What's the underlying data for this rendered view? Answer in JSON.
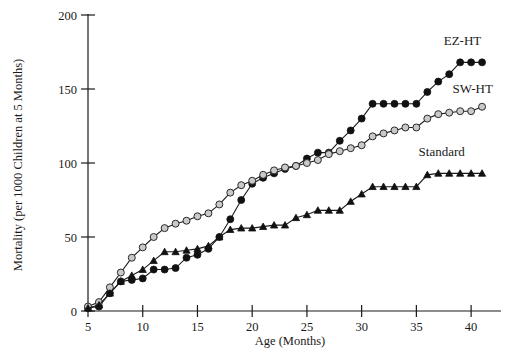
{
  "chart_data": {
    "type": "line",
    "title": "",
    "xlabel": "Age (Months)",
    "ylabel": "Mortality (per 1000 Children at 5 Months)",
    "xlim": [
      4,
      41.5
    ],
    "ylim": [
      0,
      200
    ],
    "xticks": [
      5,
      10,
      15,
      20,
      25,
      30,
      35,
      40
    ],
    "yticks": [
      0,
      50,
      100,
      150,
      200
    ],
    "grid": false,
    "legend_position": "right-inline-annotations",
    "x": [
      5,
      6,
      7,
      8,
      9,
      10,
      11,
      12,
      13,
      14,
      15,
      16,
      17,
      18,
      19,
      20,
      21,
      22,
      23,
      24,
      25,
      26,
      27,
      28,
      29,
      30,
      31,
      32,
      33,
      34,
      35,
      36,
      37,
      38,
      39,
      40,
      41
    ],
    "series": [
      {
        "name": "EZ-HT",
        "marker": "filled-circle",
        "values": [
          2,
          3,
          12,
          20,
          21,
          22,
          28,
          28,
          29,
          36,
          38,
          42,
          50,
          62,
          75,
          86,
          90,
          93,
          96,
          98,
          103,
          107,
          107,
          115,
          122,
          130,
          140,
          140,
          140,
          140,
          140,
          148,
          155,
          160,
          168,
          168,
          168
        ]
      },
      {
        "name": "SW-HT",
        "marker": "open-circle",
        "values": [
          3,
          6,
          16,
          26,
          36,
          43,
          50,
          56,
          59,
          61,
          64,
          66,
          72,
          80,
          85,
          88,
          92,
          95,
          97,
          98,
          100,
          102,
          106,
          108,
          110,
          112,
          118,
          120,
          122,
          124,
          124,
          130,
          133,
          134,
          135,
          135,
          138
        ]
      },
      {
        "name": "Standard",
        "marker": "triangle",
        "values": [
          2,
          4,
          12,
          20,
          24,
          28,
          34,
          40,
          40,
          41,
          42,
          44,
          50,
          55,
          56,
          56,
          57,
          58,
          58,
          63,
          65,
          68,
          68,
          68,
          74,
          79,
          84,
          84,
          84,
          84,
          84,
          92,
          93,
          93,
          93,
          93,
          93
        ]
      }
    ],
    "annotations": [
      {
        "text": "EZ-HT",
        "x": 37.5,
        "y": 180
      },
      {
        "text": "SW-HT",
        "x": 38.3,
        "y": 147
      },
      {
        "text": "Standard",
        "x": 35.2,
        "y": 105
      }
    ]
  },
  "axis": {
    "y_title": "Mortality (per 1000 Children at 5 Months)",
    "x_title": "Age (Months)",
    "y_tick_labels": [
      "0",
      "50",
      "100",
      "150",
      "200"
    ],
    "x_tick_labels": [
      "5",
      "10",
      "15",
      "20",
      "25",
      "30",
      "35",
      "40"
    ]
  },
  "colors": {
    "axis": "#1a1a1a",
    "ez_ht_marker": "#111111",
    "sw_ht_marker": "#c9c9c9",
    "standard_marker": "#111111",
    "background": "#ffffff"
  }
}
